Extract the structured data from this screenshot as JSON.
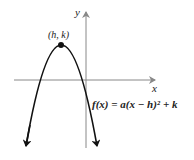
{
  "diagram": {
    "type": "parabola-graph",
    "axes": {
      "x_label": "x",
      "y_label": "y"
    },
    "vertex_label": "(h, k)",
    "equation": "f(x) = a(x − h)² + k",
    "opens": "down",
    "colors": {
      "curve": "#111111",
      "axis": "#888888",
      "text": "#222222"
    }
  }
}
